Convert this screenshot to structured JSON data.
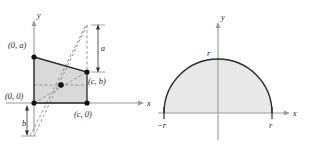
{
  "figure_set": {
    "title": "",
    "panel_count": 2
  },
  "colors": {
    "axis": "#9a9a9a",
    "outline": "#2b2b2b",
    "fill": "#d9d9d9",
    "dashed": "#8c8c8c",
    "point": "#111111",
    "label": "#1a1a1a",
    "background": "#ffffff"
  },
  "left_figure": {
    "name": "quadrilateral-centroid-figure",
    "axes": {
      "x_axis_label": "x",
      "y_axis_label": "y"
    },
    "vertex_labels": [
      {
        "id": "top-left",
        "text": "(0, a)"
      },
      {
        "id": "origin",
        "text": "(0, 0)"
      },
      {
        "id": "right-upper",
        "text": "(c, b)"
      },
      {
        "id": "right-lower",
        "text": "(c, 0)"
      }
    ],
    "dimension_labels": [
      {
        "id": "dimension-a",
        "text": "a"
      },
      {
        "id": "dimension-b",
        "text": "b"
      }
    ],
    "shape": {
      "type": "quadrilateral",
      "description": "shaded quadrilateral with vertices (0,0), (c,0), (c,b), (0,a)",
      "has_centroid_point": true,
      "dashed_diagonals": 4
    }
  },
  "right_figure": {
    "name": "semicircle-figure",
    "axes": {
      "x_axis_label": "x",
      "y_axis_label": "y"
    },
    "tick_labels": [
      {
        "id": "x-neg-r",
        "text": "−r"
      },
      {
        "id": "x-pos-r",
        "text": "r"
      },
      {
        "id": "y-r",
        "text": "r"
      }
    ],
    "shape": {
      "type": "semicircle",
      "description": "shaded upper half-disk of radius r centered at origin",
      "radius_label": "r"
    }
  }
}
